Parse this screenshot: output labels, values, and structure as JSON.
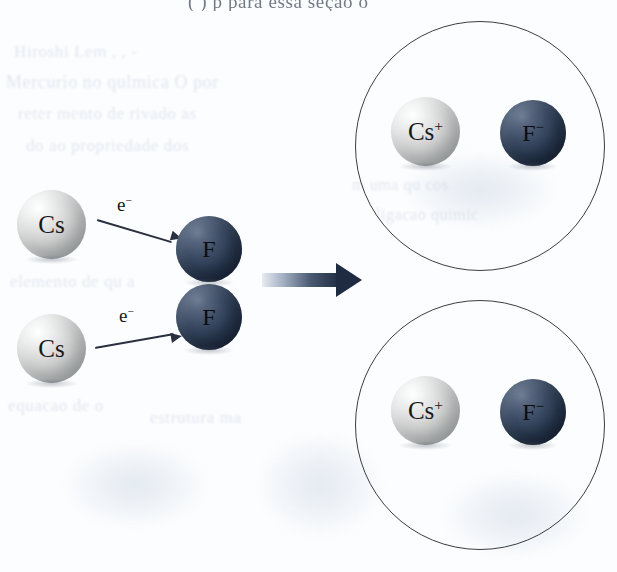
{
  "figure": {
    "kind": "chemistry-reaction-diagram",
    "background_color": "#fcfdfe"
  },
  "colors": {
    "sphere_light": "#cdcecd",
    "sphere_dark": "#2f3f57",
    "outline": "#3a3d42",
    "arrow": "#1f2b40",
    "text": "#15171c",
    "ghost_text": "#c8d2e0"
  },
  "reactants": {
    "metal_atoms": [
      {
        "label": "Cs",
        "charge": "",
        "type": "light-sphere"
      },
      {
        "label": "Cs",
        "charge": "",
        "type": "light-sphere"
      }
    ],
    "nonmetal_atoms": [
      {
        "label": "F",
        "charge": "",
        "type": "dark-sphere"
      },
      {
        "label": "F",
        "charge": "",
        "type": "dark-sphere"
      }
    ],
    "electron_transfers": [
      {
        "label": "e",
        "charge": "−",
        "from": "Cs",
        "to": "F"
      },
      {
        "label": "e",
        "charge": "−",
        "from": "Cs",
        "to": "F"
      }
    ]
  },
  "reaction_arrow": {
    "direction": "right",
    "style": "gradient-block-arrow"
  },
  "products": {
    "units": [
      {
        "name": "caesium-fluoride-ion-pair-top",
        "cation": {
          "label": "Cs",
          "charge": "+",
          "type": "light-sphere"
        },
        "anion": {
          "label": "F",
          "charge": "−",
          "type": "dark-sphere"
        }
      },
      {
        "name": "caesium-fluoride-ion-pair-bottom",
        "cation": {
          "label": "Cs",
          "charge": "+",
          "type": "light-sphere"
        },
        "anion": {
          "label": "F",
          "charge": "−",
          "type": "dark-sphere"
        }
      }
    ]
  },
  "page_artifacts": {
    "top_clipped_line": "(                   )             p        para essa seção o",
    "ghost_lines": [
      "Hiroshi Lem        ,              ,   -  ",
      "Mercurio     no  qulmica   O  por  ",
      "reter   mento de     rivado  as",
      "do     ao  propriedade  dos",
      "elemento  de   qu  a  ",
      "m uma  qu   cos",
      "ligacao     quimic",
      "equacao  de   o",
      "estrutura  ma"
    ]
  }
}
